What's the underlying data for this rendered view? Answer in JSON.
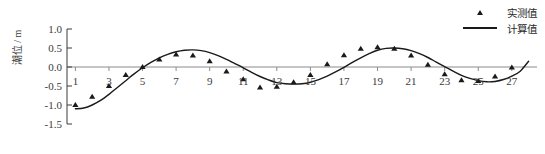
{
  "chart_data": {
    "type": "line",
    "title": "",
    "subtitle": "",
    "xlabel": "",
    "ylabel": "潮位 / m",
    "xlim": [
      0.5,
      28.5
    ],
    "ylim": [
      -1.5,
      1.0
    ],
    "yticks": [
      1.0,
      0.5,
      0.0,
      -0.5,
      -1.0,
      -1.5
    ],
    "ytick_labels": [
      "1.0",
      "0.5",
      "0.0",
      "-0.5",
      "-1.0",
      "-1.5"
    ],
    "xticks": [
      1,
      3,
      5,
      7,
      9,
      11,
      13,
      15,
      17,
      19,
      21,
      23,
      25,
      27
    ],
    "xtick_labels": [
      "1",
      "3",
      "5",
      "7",
      "9",
      "11",
      "13",
      "15",
      "17",
      "19",
      "21",
      "23",
      "25",
      "27"
    ],
    "grid": false,
    "legend_position": "top-right",
    "series": [
      {
        "name": "实测值",
        "type": "scatter",
        "marker": "triangle",
        "color": "#1a1a1a",
        "x": [
          1,
          2,
          3,
          4,
          5,
          6,
          7,
          8,
          9,
          10,
          11,
          12,
          13,
          14,
          15,
          16,
          17,
          18,
          19,
          20,
          21,
          22,
          23,
          24,
          25,
          26,
          27
        ],
        "values": [
          -1.0,
          -0.78,
          -0.5,
          -0.21,
          0.0,
          0.2,
          0.33,
          0.3,
          0.15,
          -0.12,
          -0.32,
          -0.54,
          -0.52,
          -0.4,
          -0.21,
          0.07,
          0.31,
          0.48,
          0.52,
          0.48,
          0.3,
          0.06,
          -0.19,
          -0.35,
          -0.37,
          -0.25,
          -0.01
        ]
      },
      {
        "name": "计算值",
        "type": "line",
        "color": "#1a1a1a",
        "x": [
          1,
          1.5,
          2,
          2.5,
          3,
          3.5,
          4,
          4.5,
          5,
          5.5,
          6,
          6.5,
          7,
          7.5,
          8,
          8.5,
          9,
          9.5,
          10,
          10.5,
          11,
          11.5,
          12,
          12.5,
          13,
          13.5,
          14,
          14.5,
          15,
          15.5,
          16,
          16.5,
          17,
          17.5,
          18,
          18.5,
          19,
          19.5,
          20,
          20.5,
          21,
          21.5,
          22,
          22.5,
          23,
          23.5,
          24,
          24.5,
          25,
          25.5,
          26,
          26.5,
          27,
          27.5,
          28
        ],
        "values": [
          -1.1,
          -1.08,
          -1.0,
          -0.88,
          -0.72,
          -0.54,
          -0.36,
          -0.18,
          -0.02,
          0.12,
          0.24,
          0.33,
          0.4,
          0.44,
          0.45,
          0.43,
          0.38,
          0.3,
          0.2,
          0.09,
          -0.02,
          -0.14,
          -0.25,
          -0.34,
          -0.41,
          -0.44,
          -0.45,
          -0.44,
          -0.4,
          -0.33,
          -0.24,
          -0.13,
          -0.01,
          0.12,
          0.24,
          0.35,
          0.44,
          0.49,
          0.5,
          0.48,
          0.43,
          0.35,
          0.25,
          0.13,
          0.01,
          -0.11,
          -0.22,
          -0.3,
          -0.36,
          -0.39,
          -0.38,
          -0.33,
          -0.24,
          -0.11,
          0.15
        ]
      }
    ]
  },
  "legend": {
    "items": [
      {
        "label": "实测值",
        "marker": "triangle"
      },
      {
        "label": "计算值",
        "marker": "line"
      }
    ]
  }
}
